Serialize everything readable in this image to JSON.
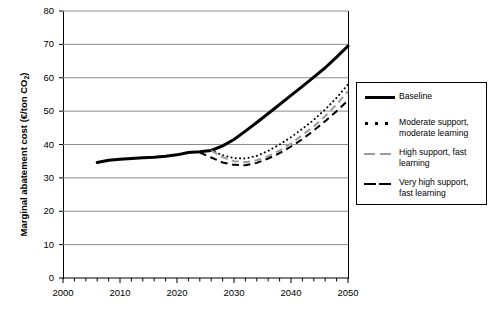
{
  "chart_data": {
    "type": "line",
    "title": "",
    "xlabel": "",
    "ylabel": "Marginal abatement cost (€/ton CO₂)",
    "xlim": [
      2000,
      2050
    ],
    "ylim": [
      0,
      80
    ],
    "ytick_labels": [
      "0",
      "10",
      "20",
      "30",
      "40",
      "50",
      "60",
      "70",
      "80"
    ],
    "ytick_values": [
      0,
      10,
      20,
      30,
      40,
      50,
      60,
      70,
      80
    ],
    "xtick_labels": [
      "2000",
      "2010",
      "2020",
      "2030",
      "2040",
      "2050"
    ],
    "xtick_values": [
      2000,
      2010,
      2020,
      2030,
      2040,
      2050
    ],
    "minor_xtick_step": 2,
    "grid": "horizontal",
    "legend_position": "right-outside",
    "series": [
      {
        "name": "Baseline",
        "style": "solid",
        "color": "#000000",
        "width": 3,
        "x": [
          2006,
          2008,
          2010,
          2012,
          2014,
          2016,
          2018,
          2020,
          2022,
          2024,
          2026,
          2028,
          2030,
          2032,
          2034,
          2036,
          2038,
          2040,
          2042,
          2044,
          2046,
          2048,
          2050
        ],
        "y": [
          34.6,
          35.3,
          35.6,
          35.8,
          36.0,
          36.2,
          36.5,
          36.9,
          37.6,
          37.8,
          38.2,
          39.6,
          41.5,
          44.0,
          46.6,
          49.3,
          52.0,
          54.7,
          57.4,
          60.2,
          63.0,
          66.2,
          69.5
        ]
      },
      {
        "name": "Moderate support, moderate learning",
        "style": "dotted",
        "color": "#000000",
        "width": 2,
        "x": [
          2026,
          2028,
          2030,
          2032,
          2034,
          2036,
          2038,
          2040,
          2042,
          2044,
          2046,
          2048,
          2050
        ],
        "y": [
          38.2,
          36.8,
          35.9,
          35.8,
          36.6,
          38.1,
          40.0,
          42.2,
          44.7,
          47.4,
          50.5,
          54.0,
          58.0
        ]
      },
      {
        "name": "High support, fast learning",
        "style": "dashed",
        "color": "#9a9a9a",
        "width": 2,
        "x": [
          2026,
          2028,
          2030,
          2032,
          2034,
          2036,
          2038,
          2040,
          2042,
          2044,
          2046,
          2048,
          2050
        ],
        "y": [
          38.2,
          36.2,
          35.0,
          34.7,
          35.3,
          36.5,
          38.2,
          40.3,
          42.8,
          45.5,
          48.5,
          52.0,
          56.0
        ]
      },
      {
        "name": "Very high support, fast learning",
        "style": "dashed",
        "color": "#000000",
        "width": 2,
        "x": [
          2024,
          2026,
          2028,
          2030,
          2032,
          2034,
          2036,
          2038,
          2040,
          2042,
          2044,
          2046,
          2048,
          2050
        ],
        "y": [
          37.6,
          36.1,
          34.6,
          33.9,
          33.8,
          34.5,
          35.8,
          37.4,
          39.4,
          41.6,
          44.2,
          47.0,
          50.0,
          53.2
        ]
      }
    ]
  },
  "legend": {
    "entries": [
      {
        "label": "Baseline",
        "key": "solid-line-key"
      },
      {
        "label": "Moderate support,\nmoderate learning",
        "line1": "Moderate support,",
        "line2": "moderate learning",
        "key": "dotted-line-key"
      },
      {
        "label": "High support, fast\nlearning",
        "line1": "High support, fast",
        "line2": "learning",
        "key": "grey-dashed-line-key"
      },
      {
        "label": "Very high support,\nfast learning",
        "line1": "Very high support,",
        "line2": "fast learning",
        "key": "black-dashed-line-key"
      }
    ]
  },
  "colors": {
    "axis": "#000000",
    "grid": "#8c8c8c",
    "baseline": "#000000",
    "grey_series": "#9a9a9a",
    "background": "#ffffff"
  }
}
